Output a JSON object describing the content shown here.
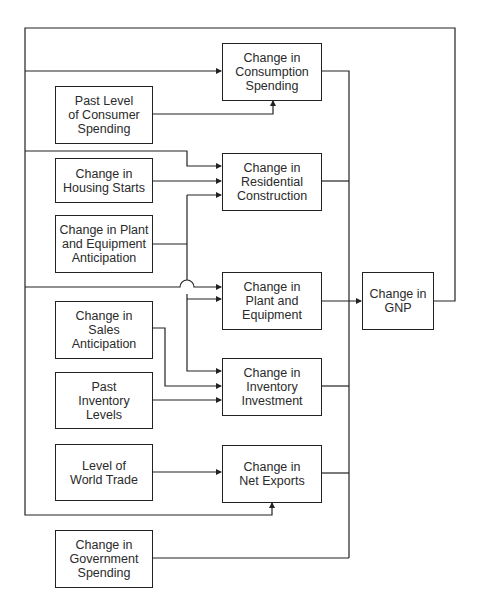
{
  "diagram": {
    "title": "",
    "nodes": {
      "consumption": "Change in\nConsumption\nSpending",
      "past_consumer": "Past Level\nof Consumer\nSpending",
      "housing": "Change in\nHousing Starts",
      "residential": "Change in\nResidential\nConstruction",
      "pe_anticipation": "Change in Plant\nand Equipment\nAnticipation",
      "plant_equipment": "Change in\nPlant and\nEquipment",
      "gnp": "Change in\nGNP",
      "sales": "Change in\nSales\nAnticipation",
      "past_inventory": "Past\nInventory\nLevels",
      "inventory": "Change in\nInventory\nInvestment",
      "world_trade": "Level of\nWorld Trade",
      "net_exports": "Change in\nNet Exports",
      "government": "Change in\nGovernment\nSpending"
    },
    "edges": [
      {
        "from": "gnp",
        "to": "consumption"
      },
      {
        "from": "gnp",
        "to": "residential"
      },
      {
        "from": "gnp",
        "to": "plant_equipment"
      },
      {
        "from": "gnp",
        "to": "net_exports"
      },
      {
        "from": "past_consumer",
        "to": "consumption"
      },
      {
        "from": "housing",
        "to": "residential"
      },
      {
        "from": "pe_anticipation",
        "to": "residential"
      },
      {
        "from": "pe_anticipation",
        "to": "plant_equipment"
      },
      {
        "from": "pe_anticipation",
        "to": "inventory"
      },
      {
        "from": "sales",
        "to": "inventory"
      },
      {
        "from": "past_inventory",
        "to": "inventory"
      },
      {
        "from": "world_trade",
        "to": "net_exports"
      },
      {
        "from": "consumption",
        "to": "gnp"
      },
      {
        "from": "residential",
        "to": "gnp"
      },
      {
        "from": "plant_equipment",
        "to": "gnp"
      },
      {
        "from": "inventory",
        "to": "gnp"
      },
      {
        "from": "net_exports",
        "to": "gnp"
      },
      {
        "from": "government",
        "to": "gnp"
      }
    ],
    "colors": {
      "line": "#222222",
      "background": "#ffffff"
    }
  }
}
